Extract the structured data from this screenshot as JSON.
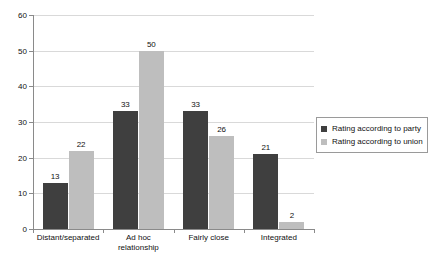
{
  "chart_data": {
    "type": "bar",
    "title": "",
    "subtitle": "",
    "xlabel": "",
    "ylabel": "",
    "ylim": [
      0,
      60
    ],
    "ytick_step": 10,
    "yticks": [
      "0",
      "10",
      "20",
      "30",
      "40",
      "50",
      "60"
    ],
    "grid": true,
    "legend_position": "right",
    "categories": [
      "Distant/separated",
      "Ad hoc\nrelationship",
      "Fairly close",
      "Integrated"
    ],
    "series": [
      {
        "name": "Rating according to party",
        "color": "#3f3f3f",
        "values": [
          13,
          33,
          33,
          21
        ],
        "labels": [
          "13",
          "33",
          "33",
          "21"
        ]
      },
      {
        "name": "Rating according to union",
        "color": "#bebebe",
        "values": [
          22,
          50,
          26,
          2
        ],
        "labels": [
          "22",
          "50",
          "26",
          "2"
        ]
      }
    ]
  },
  "legend": {
    "items": [
      {
        "label": "Rating according to party"
      },
      {
        "label": "Rating according to union"
      }
    ]
  }
}
